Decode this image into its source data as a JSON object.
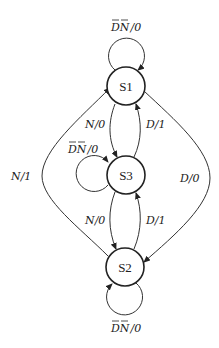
{
  "diagram": {
    "type": "state-diagram",
    "states": [
      {
        "id": "S1",
        "label": "S1"
      },
      {
        "id": "S3",
        "label": "S3"
      },
      {
        "id": "S2",
        "label": "S2"
      }
    ],
    "transitions": [
      {
        "from": "S1",
        "to": "S1",
        "label_d": "D",
        "label_n": "N",
        "label_out": "/0"
      },
      {
        "from": "S1",
        "to": "S3",
        "label": "N/0"
      },
      {
        "from": "S3",
        "to": "S1",
        "label": "D/1"
      },
      {
        "from": "S3",
        "to": "S3",
        "label_d": "D",
        "label_n": "N",
        "label_out": "/0"
      },
      {
        "from": "S3",
        "to": "S2",
        "label": "N/0"
      },
      {
        "from": "S2",
        "to": "S3",
        "label": "D/1"
      },
      {
        "from": "S2",
        "to": "S1",
        "label": "N/1"
      },
      {
        "from": "S1",
        "to": "S2",
        "label": "D/0"
      },
      {
        "from": "S2",
        "to": "S2",
        "label_d": "D",
        "label_n": "N",
        "label_out": "/0"
      }
    ]
  }
}
